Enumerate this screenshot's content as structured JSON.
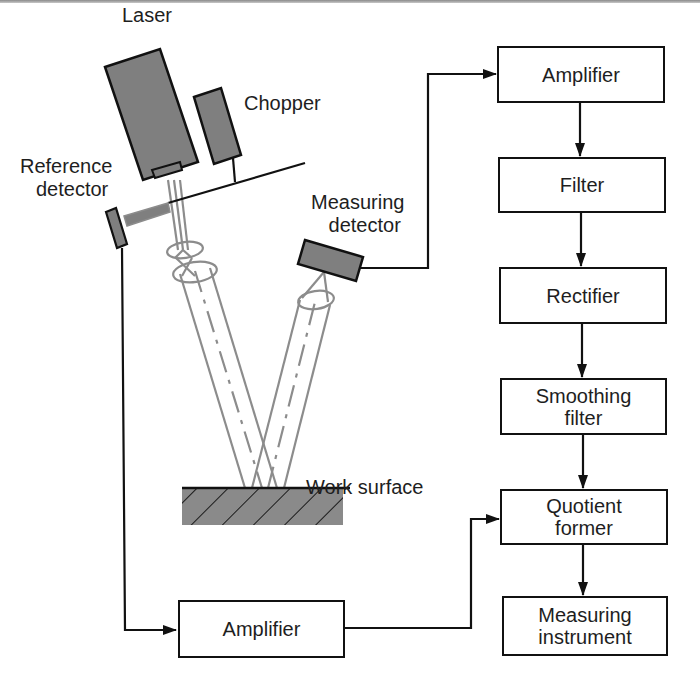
{
  "diagram": {
    "type": "optical surface-roughness measurement setup with signal-processing block diagram",
    "components": {
      "laser": "Laser",
      "chopper": "Chopper",
      "reference_detector": [
        "Reference",
        "detector"
      ],
      "measuring_detector": [
        "Measuring",
        "detector"
      ],
      "work_surface": "Work surface"
    },
    "signal_chain": [
      {
        "id": "amplifier_top",
        "lines": [
          "Amplifier"
        ]
      },
      {
        "id": "filter",
        "lines": [
          "Filter"
        ]
      },
      {
        "id": "rectifier",
        "lines": [
          "Rectifier"
        ]
      },
      {
        "id": "smoothing_filter",
        "lines": [
          "Smoothing",
          "filter"
        ]
      },
      {
        "id": "quotient_former",
        "lines": [
          "Quotient",
          "former"
        ]
      },
      {
        "id": "measuring_instrument",
        "lines": [
          "Measuring",
          "instrument"
        ]
      }
    ],
    "reference_chain": [
      {
        "id": "amplifier_bottom",
        "lines": [
          "Amplifier"
        ]
      }
    ],
    "connections": [
      "Measuring detector -> Amplifier (top)",
      "Amplifier (top) -> Filter",
      "Filter -> Rectifier",
      "Rectifier -> Smoothing filter",
      "Smoothing filter -> Quotient former",
      "Reference detector -> Amplifier (bottom)",
      "Amplifier (bottom) -> Quotient former",
      "Quotient former -> Measuring instrument"
    ],
    "colors": {
      "component_fill": "#7f7f7f",
      "beam": "#8c8c8c",
      "line": "#111111",
      "surface_fill": "#8a8a8a"
    }
  }
}
